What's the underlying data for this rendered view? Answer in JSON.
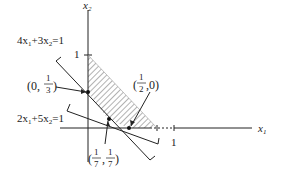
{
  "diagram": {
    "axes": {
      "x_label": "x",
      "x_sub": "1",
      "y_label": "x",
      "y_sub": "2",
      "x_tick_label": "1",
      "y_tick_label": "1"
    },
    "lines": [
      {
        "id": "line-a",
        "label_parts": [
          "4x",
          "1",
          "+3x",
          "2",
          "=1"
        ]
      },
      {
        "id": "line-b",
        "label_parts": [
          "2x",
          "1",
          "+5x",
          "2",
          "=1"
        ]
      }
    ],
    "points": [
      {
        "id": "p-0-third",
        "label_open": "(0,",
        "num": "1",
        "den": "3",
        "label_close": ")"
      },
      {
        "id": "p-half-0",
        "label_open": "(",
        "num": "1",
        "den": "2",
        "label_close": ",0)"
      },
      {
        "id": "p-seventh",
        "label_open": "(",
        "num1": "1",
        "den1": "7",
        "sep": ",",
        "num2": "1",
        "den2": "7",
        "label_close": ")"
      }
    ],
    "colors": {
      "stroke": "#222222",
      "hatch": "#555555",
      "background": "#ffffff"
    }
  }
}
